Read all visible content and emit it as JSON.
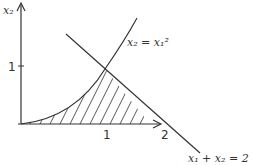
{
  "diagram": {
    "type": "region-plot",
    "axes": {
      "x_label": "",
      "y_label": "x₂",
      "x_ticks": [
        "1",
        "2"
      ],
      "y_ticks": [
        "1"
      ]
    },
    "curves": [
      {
        "name": "parabola",
        "equation": "x₂ = x₁²"
      },
      {
        "name": "line",
        "equation": "x₁ + x₂ = 2"
      }
    ],
    "labels": {
      "y_axis": "x₂",
      "y_tick_1": "1",
      "x_tick_1": "1",
      "x_tick_2": "2",
      "parabola": "x₂ = x₁²",
      "line": "x₁ + x₂ = 2"
    },
    "region": "hatched area under x₂ = x₁² and x₁ + x₂ = 2, above x-axis",
    "colors": {
      "stroke": "#333333",
      "background": "#ffffff"
    }
  }
}
